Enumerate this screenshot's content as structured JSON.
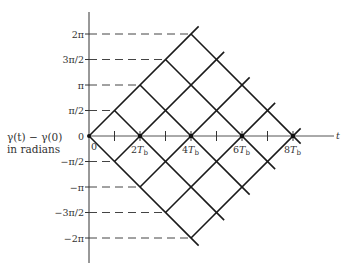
{
  "diagram": {
    "type": "phase-trellis",
    "y_axis_label_line1": "γ(t) − γ(0)",
    "y_axis_label_line2": "in radians",
    "x_axis_label": "t",
    "origin_label": "0",
    "y_ticks": [
      {
        "label": "2π",
        "value": 4
      },
      {
        "label": "3π/2",
        "value": 3
      },
      {
        "label": "π",
        "value": 2
      },
      {
        "label": "π/2",
        "value": 1
      },
      {
        "label": "0",
        "value": 0
      },
      {
        "label": "−π/2",
        "value": -1
      },
      {
        "label": "−π",
        "value": -2
      },
      {
        "label": "−3π/2",
        "value": -3
      },
      {
        "label": "−2π",
        "value": -4
      }
    ],
    "x_ticks": [
      {
        "label": "",
        "value": 1
      },
      {
        "label": "2T",
        "sub": "b",
        "value": 2
      },
      {
        "label": "",
        "value": 3
      },
      {
        "label": "4T",
        "sub": "b",
        "value": 4
      },
      {
        "label": "",
        "value": 5
      },
      {
        "label": "6T",
        "sub": "b",
        "value": 6
      },
      {
        "label": "",
        "value": 7
      },
      {
        "label": "8T",
        "sub": "b",
        "value": 8
      }
    ],
    "trellis": {
      "up_lines": [
        [
          0,
          0,
          4,
          4
        ],
        [
          1,
          -1,
          5,
          3
        ],
        [
          2,
          -2,
          6,
          2
        ],
        [
          3,
          -3,
          7,
          1
        ],
        [
          4,
          -4,
          8,
          0
        ]
      ],
      "down_lines": [
        [
          0,
          0,
          4,
          -4
        ],
        [
          1,
          1,
          5,
          -3
        ],
        [
          2,
          2,
          6,
          -2
        ],
        [
          3,
          3,
          7,
          -1
        ],
        [
          4,
          4,
          8,
          0
        ]
      ]
    },
    "colors": {
      "line": "#1a1a1a",
      "axis": "#333333",
      "text": "#333333"
    }
  }
}
